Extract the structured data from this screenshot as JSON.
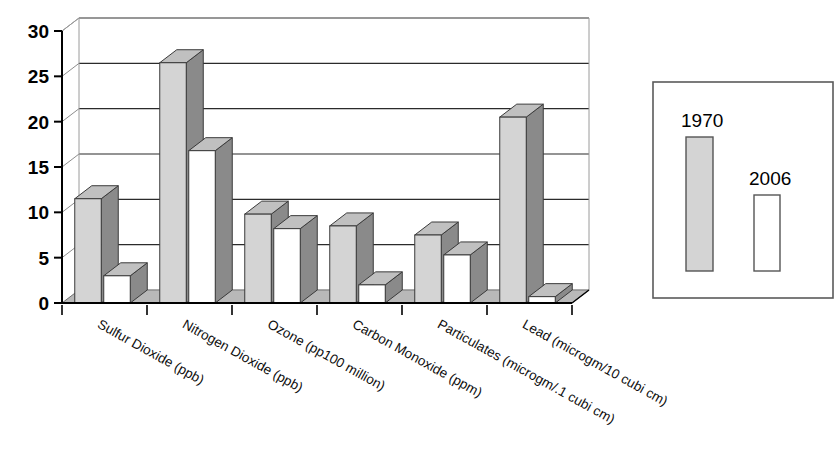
{
  "chart_data": {
    "type": "bar",
    "title": "",
    "subtitle": "",
    "xlabel": "",
    "ylabel": "",
    "ylim": [
      0,
      30
    ],
    "yticks": [
      0,
      5,
      10,
      15,
      20,
      25,
      30
    ],
    "grid": true,
    "legend_position": "right",
    "style": "3d-clustered-column",
    "categories": [
      "Sulfur Dioxide (ppb)",
      "Nitrogen Dioxide (ppb)",
      "Ozone (pp100 million)",
      "Carbon Monoxide (ppm)",
      "Particulates (microgm/.1 cubi cm)",
      "Lead (microgm/10 cubi cm)"
    ],
    "series": [
      {
        "name": "1970",
        "color": "#d4d4d4",
        "values": [
          11.5,
          26.5,
          9.8,
          8.5,
          7.5,
          20.5
        ]
      },
      {
        "name": "2006",
        "color": "#ffffff",
        "values": [
          3.0,
          16.8,
          8.2,
          2.0,
          5.3,
          0.7
        ]
      }
    ]
  },
  "legend": {
    "entries": [
      {
        "label": "1970",
        "swatch": "filled-gray-bar"
      },
      {
        "label": "2006",
        "swatch": "outlined-white-bar"
      }
    ]
  },
  "colors": {
    "series_1970_face": "#d4d4d4",
    "series_2006_face": "#ffffff",
    "side_shade": "#8a8a8a",
    "top_shade": "#c0c0c0",
    "floor": "#b8b8b8",
    "axis": "#000000",
    "gridline": "#2b2b2b",
    "text": "#000000"
  }
}
